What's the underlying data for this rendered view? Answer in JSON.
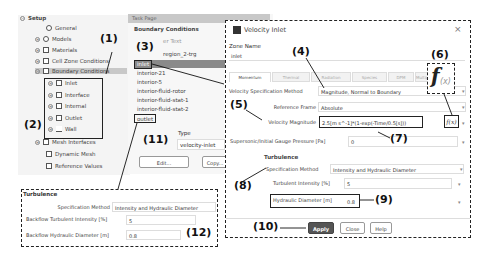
{
  "tree": {
    "root": "Setup",
    "items": [
      {
        "label": "General",
        "icon": "general-icon"
      },
      {
        "label": "Models",
        "icon": "models-icon"
      },
      {
        "label": "Materials",
        "icon": "materials-icon"
      },
      {
        "label": "Cell Zone Conditions",
        "icon": "cell-zone-icon"
      },
      {
        "label": "Boundary Conditions",
        "icon": "boundary-icon"
      },
      {
        "label": "Inlet",
        "icon": "inlet-icon"
      },
      {
        "label": "Interface",
        "icon": "interface-icon"
      },
      {
        "label": "Internal",
        "icon": "internal-icon"
      },
      {
        "label": "Outlet",
        "icon": "outlet-icon"
      },
      {
        "label": "Wall",
        "icon": "wall-icon"
      },
      {
        "label": "Mesh Interfaces",
        "icon": "mesh-interfaces-icon"
      },
      {
        "label": "Dynamic Mesh",
        "icon": "dynamic-mesh-icon"
      },
      {
        "label": "Reference Values",
        "icon": "reference-values-icon"
      }
    ]
  },
  "task": {
    "header": "Task Page",
    "title": "Boundary Conditions",
    "filter_placeholder": "er Text",
    "zones": [
      "region_2-trg",
      "inlet",
      "interior-21",
      "interior-5",
      "interior-fluid-rotor",
      "interior-fluid-stat-1",
      "interior-fluid-stat-2",
      "outlet"
    ],
    "type_label": "Type",
    "type_value": "velocity-inlet",
    "edit_label": "Edit...",
    "copy_label": "Copy..."
  },
  "dialog": {
    "title": "Velocity Inlet",
    "zone_name_label": "Zone Name",
    "zone_name_value": "inlet",
    "tabs": [
      "Momentum",
      "Thermal",
      "Radiation",
      "Species",
      "DPM",
      "Multiphase",
      "Potential"
    ],
    "vsm_label": "Velocity Specification Method",
    "vsm_value": "Magnitude, Normal to Boundary",
    "ref_frame_label": "Reference Frame",
    "ref_frame_value": "Absolute",
    "vel_mag_label": "Velocity Magnitude",
    "vel_mag_value": "2.5[m s^-1]*(1-exp(-Time/0.5[s]))",
    "fx_label": "f(x)",
    "pressure_label": "Supersonic/Initial Gauge Pressure [Pa]",
    "pressure_value": "0",
    "turbulence_title": "Turbulence",
    "spec_method_label": "Specification Method",
    "spec_method_value": "Intensity and Hydraulic Diameter",
    "ti_label": "Turbulent Intensity [%]",
    "ti_value": "5",
    "hd_label": "Hydraulic Diameter [m]",
    "hd_value": "0.8",
    "apply_label": "Apply",
    "close_label": "Close",
    "help_label": "Help",
    "close_icon": "×"
  },
  "outlet_panel": {
    "title": "Turbulence",
    "spec_method_label": "Specification Method",
    "spec_method_value": "Intensity and Hydraulic Diameter",
    "bti_label": "Backflow Turbulent Intensity [%]",
    "bti_value": "5",
    "bhd_label": "Backflow Hydraulic Diameter [m]",
    "bhd_value": "0.8"
  },
  "annotations": [
    "(1)",
    "(2)",
    "(3)",
    "(4)",
    "(5)",
    "(6)",
    "(7)",
    "(8)",
    "(9)",
    "(10)",
    "(11)",
    "(12)"
  ]
}
